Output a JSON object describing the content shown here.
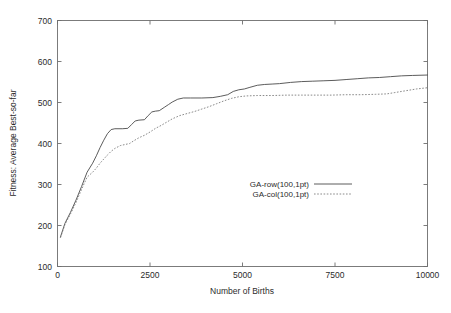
{
  "chart_data": {
    "type": "line",
    "title": "",
    "xlabel": "Number of Births",
    "ylabel": "Fitness: Average Best-so-far",
    "xlim": [
      0,
      10000
    ],
    "ylim": [
      100,
      700
    ],
    "xticks": [
      0,
      2500,
      5000,
      7500,
      10000
    ],
    "xtick_labels": [
      "0",
      "2500",
      "5000",
      "7500",
      "10000"
    ],
    "yticks": [
      100,
      200,
      300,
      400,
      500,
      600,
      700
    ],
    "ytick_labels": [
      "100",
      "200",
      "300",
      "400",
      "500",
      "600",
      "700"
    ],
    "grid": false,
    "legend_position": "center",
    "series": [
      {
        "name": "GA-row(100,1pt)",
        "style": "solid",
        "color": "#4a4a4a",
        "x": [
          80,
          200,
          350,
          500,
          650,
          800,
          950,
          1050,
          1150,
          1250,
          1350,
          1450,
          1550,
          1750,
          1900,
          2000,
          2100,
          2200,
          2350,
          2450,
          2550,
          2650,
          2750,
          2900,
          3000,
          3100,
          3250,
          3400,
          3600,
          3900,
          4200,
          4400,
          4600,
          4750,
          4900,
          5050,
          5200,
          5400,
          5600,
          5800,
          6000,
          6300,
          6600,
          6900,
          7200,
          7500,
          7800,
          8100,
          8400,
          8700,
          9000,
          9300,
          9600,
          10000
        ],
        "y": [
          172,
          205,
          232,
          262,
          295,
          330,
          352,
          370,
          390,
          408,
          424,
          434,
          436,
          436,
          437,
          446,
          455,
          457,
          458,
          468,
          477,
          479,
          480,
          489,
          495,
          501,
          508,
          511,
          511,
          511,
          512,
          515,
          519,
          527,
          531,
          533,
          537,
          542,
          544,
          545,
          546,
          549,
          551,
          552,
          553,
          554,
          556,
          558,
          560,
          561,
          563,
          565,
          566,
          567
        ]
      },
      {
        "name": "GA-col(100,1pt)",
        "style": "dotted",
        "color": "#7d7d7d",
        "x": [
          80,
          200,
          350,
          500,
          650,
          800,
          950,
          1050,
          1150,
          1250,
          1350,
          1450,
          1550,
          1700,
          1850,
          1950,
          2050,
          2200,
          2350,
          2500,
          2650,
          2800,
          2950,
          3100,
          3300,
          3500,
          3700,
          3900,
          4100,
          4300,
          4500,
          4700,
          4900,
          5100,
          5400,
          5800,
          6200,
          6600,
          7000,
          7400,
          7800,
          8200,
          8600,
          8900,
          9100,
          9300,
          9500,
          9700,
          9900,
          10000
        ],
        "y": [
          170,
          202,
          228,
          256,
          288,
          318,
          330,
          340,
          352,
          362,
          372,
          381,
          388,
          395,
          398,
          400,
          406,
          414,
          420,
          428,
          437,
          444,
          452,
          460,
          468,
          473,
          478,
          484,
          490,
          497,
          504,
          510,
          514,
          516,
          517,
          517,
          518,
          518,
          518,
          518,
          519,
          519,
          520,
          521,
          524,
          527,
          530,
          533,
          535,
          536
        ]
      }
    ]
  },
  "legend": {
    "entries": [
      {
        "label": "GA-row(100,1pt)",
        "style": "solid"
      },
      {
        "label": "GA-col(100,1pt)",
        "style": "dotted"
      }
    ]
  }
}
